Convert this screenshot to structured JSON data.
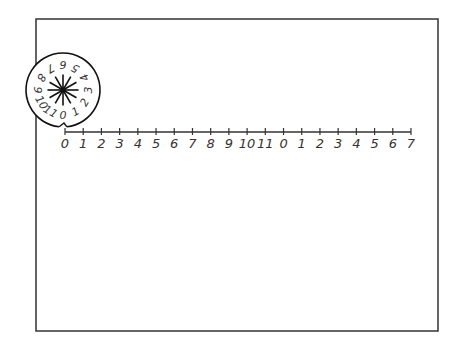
{
  "diagram": {
    "frame": {
      "x": 36,
      "y": 19,
      "width": 402,
      "height": 312,
      "stroke": "#333333"
    },
    "wheel": {
      "cx": 63,
      "cy": 90,
      "r": 37,
      "labels": [
        "0",
        "1",
        "2",
        "3",
        "4",
        "5",
        "6",
        "7",
        "8",
        "9",
        "10",
        "11"
      ],
      "stroke": "#111111"
    },
    "number_line": {
      "y": 132,
      "x_start": 65,
      "x_end": 411,
      "tick_labels": [
        "0",
        "1",
        "2",
        "3",
        "4",
        "5",
        "6",
        "7",
        "8",
        "9",
        "10",
        "11",
        "0",
        "1",
        "2",
        "3",
        "4",
        "5",
        "6",
        "7"
      ],
      "label_color": "#444444"
    }
  }
}
